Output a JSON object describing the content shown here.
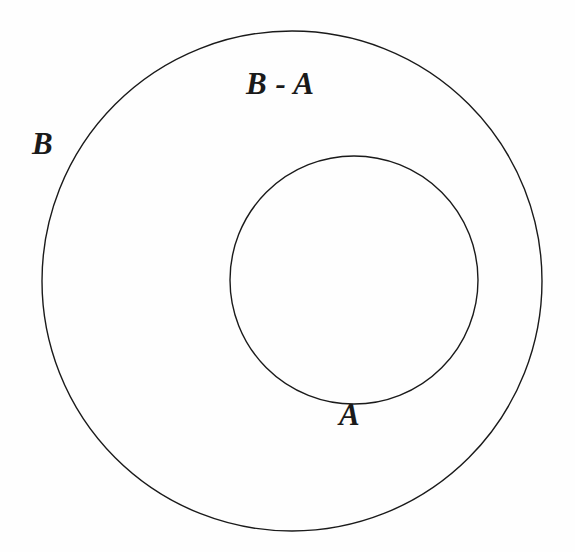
{
  "figure": {
    "kind": "venn-diagram",
    "background_color": "#fefefe",
    "stroke_color": "#1a1a1a"
  },
  "labels": {
    "outer_set": "B",
    "inner_set": "A",
    "difference_region": "B - A"
  },
  "chart_data": {
    "type": "diagram",
    "title": "",
    "shapes": [
      {
        "name": "outer-circle",
        "label": "B",
        "cx": 292,
        "cy": 281,
        "r": 250,
        "fill": "none",
        "stroke": "#1a1a1a",
        "stroke_width": 1.4
      },
      {
        "name": "inner-circle",
        "label": "A",
        "cx": 354,
        "cy": 280,
        "r": 124,
        "fill": "none",
        "stroke": "#1a1a1a",
        "stroke_width": 1.4
      }
    ],
    "annotations": [
      {
        "name": "label-b-minus-a",
        "text": "B - A",
        "x": 246,
        "y": 68,
        "font_size": 31,
        "style": "italic"
      },
      {
        "name": "label-b",
        "text": "B",
        "x": 32,
        "y": 128,
        "font_size": 31,
        "style": "italic"
      },
      {
        "name": "label-a",
        "text": "A",
        "x": 339,
        "y": 399,
        "font_size": 31,
        "style": "italic"
      }
    ],
    "relationship": "A is a proper subset of B; shaded concept region is B minus A (the annulus)"
  }
}
